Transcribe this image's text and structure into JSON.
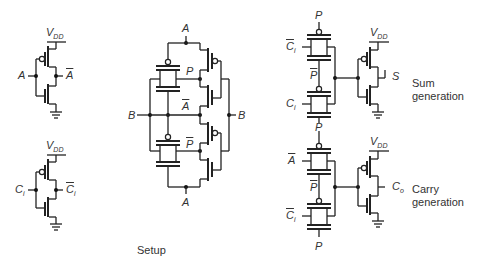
{
  "figure": {
    "setup_caption": "Setup",
    "inverter_a": {
      "supply": "V",
      "supply_sub": "DD",
      "input": "A",
      "output": "A"
    },
    "inverter_ci": {
      "supply": "V",
      "supply_sub": "DD",
      "input": "C",
      "input_sub": "i",
      "output": "C",
      "output_sub": "i"
    },
    "propagate": {
      "top": "A",
      "bottom": "A",
      "left": "B",
      "right": "B",
      "p_top": "P",
      "a_bar": "A",
      "p_bar": "P"
    },
    "sum": {
      "p_top": "P",
      "ci_bar": "C",
      "ci_bar_sub": "i",
      "p_bar": "P",
      "ci": "C",
      "ci_sub": "i",
      "supply": "V",
      "supply_sub": "DD",
      "output": "S",
      "caption_line1": "Sum",
      "caption_line2": "generation"
    },
    "carry": {
      "p_mid": "P",
      "a_bar": "A",
      "p_bar": "P",
      "ci_bar": "C",
      "ci_bar_sub": "i",
      "p_bottom": "P",
      "supply": "V",
      "supply_sub": "DD",
      "output": "C",
      "output_sub": "o",
      "caption_line1": "Carry",
      "caption_line2": "generation"
    }
  }
}
